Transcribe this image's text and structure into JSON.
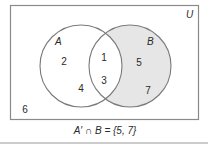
{
  "diagram": {
    "type": "venn",
    "universe_label": "U",
    "sets": [
      {
        "name": "A",
        "label": "A",
        "elements": [
          "2",
          "4",
          "1",
          "3"
        ]
      },
      {
        "name": "B",
        "label": "B",
        "elements": [
          "1",
          "3",
          "5",
          "7"
        ]
      }
    ],
    "regions": {
      "a_only": [
        "2",
        "4"
      ],
      "intersection": [
        "1",
        "3"
      ],
      "b_only": [
        "5",
        "7"
      ],
      "outside": [
        "6"
      ]
    },
    "shaded_region": "A' ∩ B",
    "shade_color": "#e6e6e6",
    "caption": "A′ ∩ B = {5, 7}"
  }
}
